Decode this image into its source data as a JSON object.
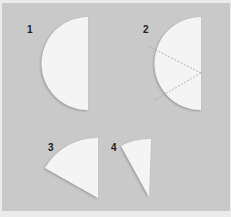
{
  "figure": {
    "steps": [
      {
        "number": "1",
        "shape": "semicircle"
      },
      {
        "number": "2",
        "shape": "semicircle with fold lines into thirds"
      },
      {
        "number": "3",
        "shape": "folded wedge"
      },
      {
        "number": "4",
        "shape": "narrow folded cone"
      }
    ],
    "colors": {
      "background": "#c9c9c9",
      "paper": "#f4f4f4",
      "shadow": "#9a9a9a",
      "fold_line": "#a8a8a8"
    }
  }
}
